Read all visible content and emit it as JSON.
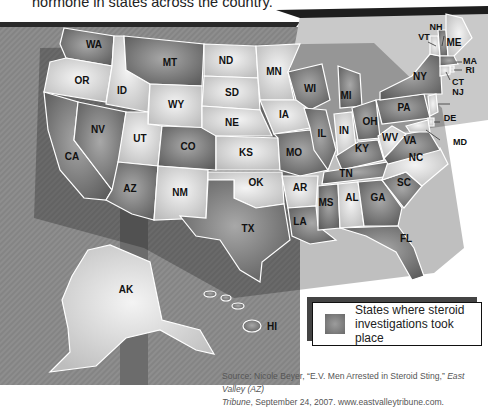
{
  "caption": "hormone in states across the country.",
  "legend": {
    "line1": "States where steroid",
    "line2": "investigations took place",
    "swatch_color": "#7d7d7d"
  },
  "source": {
    "prefix": "Source: Nicole Beyer, “E.V. Men Arrested in Steroid Sting,” ",
    "pub1": "East Valley (AZ)",
    "pub2": "Tribune",
    "suffix": ", September 24, 2007. www.eastvalleytribune.com."
  },
  "colors": {
    "investigated": "#7a7a7a",
    "not_investigated": "#d4d4d4",
    "backdrop": "#8a8a8a",
    "border": "#ffffff"
  },
  "states": {
    "WA": "WA",
    "OR": "OR",
    "CA": "CA",
    "NV": "NV",
    "ID": "ID",
    "MT": "MT",
    "WY": "WY",
    "UT": "UT",
    "AZ": "AZ",
    "CO": "CO",
    "NM": "NM",
    "ND": "ND",
    "SD": "SD",
    "NE": "NE",
    "KS": "KS",
    "OK": "OK",
    "TX": "TX",
    "MN": "MN",
    "IA": "IA",
    "MO": "MO",
    "AR": "AR",
    "LA": "LA",
    "WI": "WI",
    "IL": "IL",
    "MI": "MI",
    "IN": "IN",
    "OH": "OH",
    "KY": "KY",
    "TN": "TN",
    "MS": "MS",
    "AL": "AL",
    "GA": "GA",
    "FL": "FL",
    "SC": "SC",
    "NC": "NC",
    "VA": "VA",
    "WV": "WV",
    "PA": "PA",
    "NY": "NY",
    "VT": "VT",
    "NH": "NH",
    "ME": "ME",
    "MA": "MA",
    "RI": "RI",
    "CT": "CT",
    "NJ": "NJ",
    "DE": "DE",
    "MD": "MD",
    "AK": "AK",
    "HI": "HI"
  },
  "investigated_states": [
    "WA",
    "MT",
    "NV",
    "CA",
    "AZ",
    "CO",
    "TX",
    "WI",
    "MI",
    "IL",
    "MO",
    "MS",
    "GA",
    "FL",
    "SC",
    "OH",
    "KY",
    "TN",
    "LA",
    "NY",
    "PA",
    "VA",
    "ME",
    "MA",
    "NH"
  ]
}
